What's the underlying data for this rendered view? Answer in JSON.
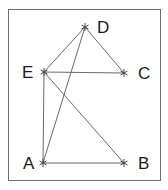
{
  "diagram": {
    "type": "graph",
    "colors": {
      "background": "#ffffff",
      "border": "#6e6e6e",
      "edge": "#6a6a6a",
      "node": "#444444",
      "label": "#1a1a1a"
    },
    "nodes": [
      {
        "id": "A",
        "label": "A",
        "x": 43,
        "y": 163
      },
      {
        "id": "B",
        "label": "B",
        "x": 124,
        "y": 163
      },
      {
        "id": "C",
        "label": "C",
        "x": 124,
        "y": 73
      },
      {
        "id": "D",
        "label": "D",
        "x": 85,
        "y": 27
      },
      {
        "id": "E",
        "label": "E",
        "x": 44,
        "y": 72
      }
    ],
    "edges": [
      [
        "A",
        "B"
      ],
      [
        "A",
        "E"
      ],
      [
        "A",
        "D"
      ],
      [
        "E",
        "D"
      ],
      [
        "E",
        "C"
      ],
      [
        "E",
        "B"
      ],
      [
        "D",
        "C"
      ]
    ]
  }
}
